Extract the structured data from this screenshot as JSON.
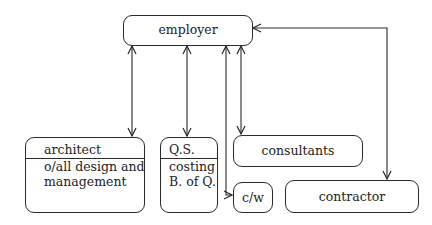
{
  "diagram": {
    "title": "",
    "nodes": {
      "employer": {
        "label": "employer"
      },
      "architect": {
        "title": "architect",
        "lines": [
          "o/all design and",
          "management"
        ]
      },
      "qs": {
        "title": "Q.S.",
        "lines": [
          "costing",
          "B. of Q."
        ]
      },
      "consultants": {
        "label": "consultants"
      },
      "cw": {
        "label": "c/w"
      },
      "contractor": {
        "label": "contractor"
      }
    },
    "edges": [
      {
        "from": "employer",
        "to": "architect",
        "type": "bidirectional"
      },
      {
        "from": "employer",
        "to": "qs",
        "type": "bidirectional"
      },
      {
        "from": "employer",
        "to": "cw",
        "type": "bidirectional"
      },
      {
        "from": "employer",
        "to": "consultants",
        "type": "bidirectional"
      },
      {
        "from": "employer",
        "to": "contractor",
        "type": "bidirectional"
      }
    ],
    "colors": {
      "line": "#2a2a2a",
      "background": "#ffffff",
      "text": "#222222"
    }
  }
}
